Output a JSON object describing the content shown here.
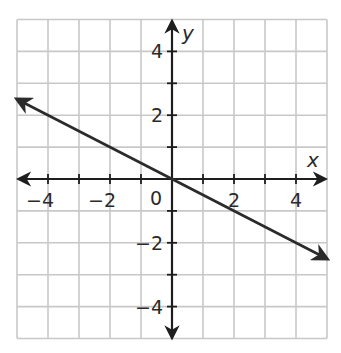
{
  "chart_data": {
    "type": "line",
    "title": "",
    "xlabel": "x",
    "ylabel": "y",
    "xlim": [
      -5,
      5
    ],
    "ylim": [
      -5,
      5
    ],
    "grid": true,
    "grid_step": 1,
    "x_ticks": [
      -4,
      -2,
      2,
      4
    ],
    "y_ticks": [
      4,
      2,
      -2,
      -4
    ],
    "x_tick_labels": [
      "−4",
      "−2",
      "2",
      "4"
    ],
    "y_tick_labels": [
      "4",
      "2",
      "−2",
      "−4"
    ],
    "origin_label": "0",
    "series": [
      {
        "name": "line",
        "equation": "y = -1/2 x",
        "slope": -0.5,
        "intercept": 0,
        "x": [
          -5,
          0,
          2,
          5
        ],
        "y": [
          2.5,
          0,
          -1,
          -2.5
        ],
        "arrows_both_ends": true,
        "color": "#2b2b2b"
      }
    ],
    "legend": null
  },
  "colors": {
    "grid": "#c8c8c8",
    "axes": "#1e1e1e",
    "line": "#2b2b2b"
  }
}
